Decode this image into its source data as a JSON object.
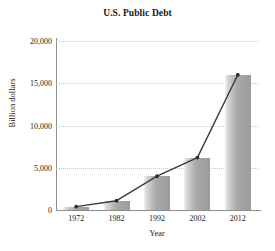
{
  "chart_data": {
    "type": "bar",
    "title": "U.S. Public Debt",
    "xlabel": "Year",
    "ylabel": "Billion dollars",
    "categories": [
      "1972",
      "1982",
      "1992",
      "2002",
      "2012"
    ],
    "values": [
      400,
      1100,
      4000,
      6200,
      16000
    ],
    "series": [
      {
        "name": "U.S. Public Debt",
        "type": "bar",
        "values": [
          400,
          1100,
          4000,
          6200,
          16000
        ]
      },
      {
        "name": "Trend",
        "type": "line",
        "values": [
          400,
          1100,
          4000,
          6200,
          16000
        ]
      }
    ],
    "ylim": [
      0,
      20000
    ],
    "yticks": [
      0,
      5000,
      10000,
      15000,
      20000
    ],
    "ytick_labels": [
      "0",
      "5,000",
      "10,000",
      "15,000",
      "20,000"
    ],
    "grid": true,
    "legend": false,
    "colors": {
      "bar_fill_light": "#d2d2d2",
      "bar_fill_dark": "#9b9b9b",
      "line": "#3a3a3a",
      "marker": "#2b2b2b",
      "grid": "#c9c9c9",
      "axis": "#8d8d8d",
      "text": "#1a1a1a",
      "background": "#ffffff"
    }
  }
}
